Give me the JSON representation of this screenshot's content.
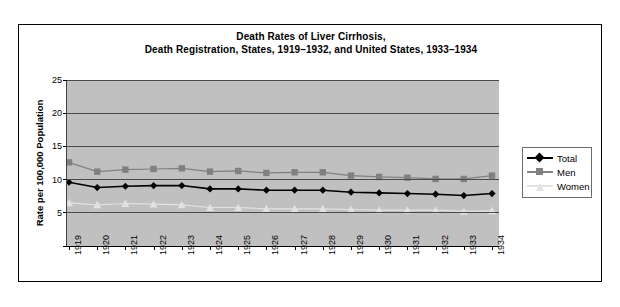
{
  "chart_data": {
    "type": "line",
    "title": "Death Rates of Liver Cirrhosis,",
    "subtitle": "Death Registration, States, 1919–1932, and United States, 1933–1934",
    "xlabel": "",
    "ylabel": "Rate per 100,000 Population",
    "ylim": [
      0,
      25
    ],
    "yticks": [
      0,
      5,
      10,
      15,
      20,
      25
    ],
    "ytick_labels": [
      "",
      "5",
      "10",
      "15",
      "20",
      "25"
    ],
    "grid": true,
    "legend_position": "right",
    "plot_background": "#c0c0c0",
    "categories": [
      "1919",
      "1920",
      "1921",
      "1922",
      "1923",
      "1924",
      "1925",
      "1926",
      "1927",
      "1928",
      "1929",
      "1930",
      "1931",
      "1932",
      "1933",
      "1934"
    ],
    "series": [
      {
        "name": "Total",
        "color": "#000000",
        "marker": "diamond",
        "values": [
          9.6,
          8.8,
          9.0,
          9.1,
          9.1,
          8.6,
          8.6,
          8.4,
          8.4,
          8.4,
          8.1,
          8.0,
          7.9,
          7.8,
          7.6,
          7.9
        ]
      },
      {
        "name": "Men",
        "color": "#808080",
        "marker": "square",
        "values": [
          12.6,
          11.2,
          11.5,
          11.6,
          11.7,
          11.2,
          11.3,
          11.0,
          11.1,
          11.1,
          10.6,
          10.4,
          10.3,
          10.1,
          10.1,
          10.6
        ]
      },
      {
        "name": "Women",
        "color": "#e2e2e2",
        "marker": "triangle",
        "values": [
          6.5,
          6.2,
          6.4,
          6.3,
          6.2,
          5.8,
          5.8,
          5.6,
          5.6,
          5.6,
          5.5,
          5.4,
          5.4,
          5.4,
          5.2,
          5.3
        ]
      }
    ]
  },
  "legend": {
    "items": [
      {
        "label": "Total"
      },
      {
        "label": "Men"
      },
      {
        "label": "Women"
      }
    ]
  }
}
